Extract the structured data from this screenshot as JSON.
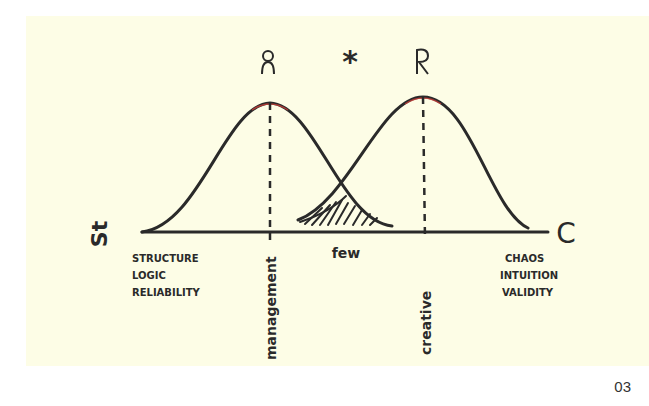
{
  "diagram": {
    "axis": {
      "left_symbol": "St",
      "right_symbol": "C",
      "left_labels": [
        "STRUCTURE",
        "LOGIC",
        "RELIABILITY"
      ],
      "right_labels": [
        "CHAOS",
        "INTUITION",
        "VALIDITY"
      ]
    },
    "curves": [
      {
        "name": "management",
        "label": "management",
        "figure": "person-icon"
      },
      {
        "name": "creative",
        "label": "creative",
        "figure": "person-icon"
      }
    ],
    "overlap_label": "few",
    "star_symbol": "*",
    "colors": {
      "paper": "#fdfde6",
      "ink": "#2a2a2a",
      "peak_highlight": "#e0403a"
    }
  },
  "page_number": "03"
}
